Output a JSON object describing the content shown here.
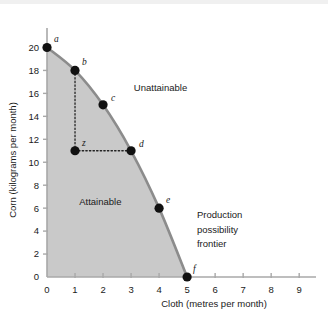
{
  "chart_data": {
    "type": "line",
    "title": "",
    "xlabel": "Cloth (metres per month)",
    "ylabel": "Corn (kilograms per month)",
    "xlim": [
      0,
      9.6
    ],
    "ylim": [
      0,
      21
    ],
    "xticks": [
      "0",
      "1",
      "2",
      "3",
      "4",
      "5",
      "6",
      "7",
      "8",
      "9"
    ],
    "xtick_values": [
      0,
      1,
      2,
      3,
      4,
      5,
      6,
      7,
      8,
      9
    ],
    "yticks": [
      "0",
      "2",
      "4",
      "6",
      "8",
      "10",
      "12",
      "14",
      "16",
      "18",
      "20"
    ],
    "ytick_values": [
      0,
      2,
      4,
      6,
      8,
      10,
      12,
      14,
      16,
      18,
      20
    ],
    "grid": false,
    "legend": "none",
    "series": [
      {
        "name": "Production possibility frontier",
        "x": [
          0,
          1,
          2,
          3,
          4,
          5
        ],
        "values": [
          20,
          18,
          15,
          11,
          6,
          0
        ],
        "point_labels": [
          "a",
          "b",
          "c",
          "d",
          "e",
          "f"
        ]
      }
    ],
    "interior_points": [
      {
        "label": "z",
        "x": 1,
        "y": 11
      }
    ],
    "guide_lines": [
      {
        "from": "b",
        "to": "z",
        "x1": 1,
        "y1": 18,
        "x2": 1,
        "y2": 11,
        "style": "dotted"
      },
      {
        "from": "z",
        "to": "d",
        "x1": 1,
        "y1": 11,
        "x2": 3,
        "y2": 11,
        "style": "dotted"
      }
    ],
    "annotations": [
      {
        "name": "attainable",
        "text": "Attainable",
        "x": 1.15,
        "y": 6.3
      },
      {
        "name": "unattainable",
        "text": "Unattainable",
        "x": 3.1,
        "y": 16.2
      },
      {
        "name": "frontier-line1",
        "text": "Production",
        "x": 5.35,
        "y": 5.1
      },
      {
        "name": "frontier-line2",
        "text": "possibility",
        "x": 5.35,
        "y": 3.85
      },
      {
        "name": "frontier-line3",
        "text": "frontier",
        "x": 5.35,
        "y": 2.6
      }
    ],
    "colors": {
      "attainable_fill": "#c9c9c9",
      "frontier_line": "#8c8c8c",
      "axis": "#a8a8a8",
      "point": "#111111",
      "text": "#1a1a1a",
      "background": "#ffffff"
    }
  }
}
